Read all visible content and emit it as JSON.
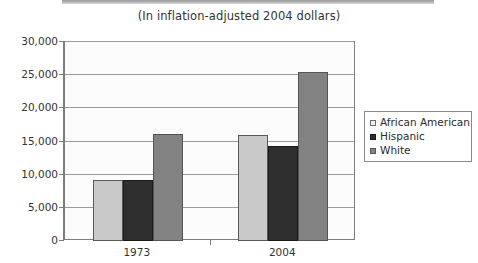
{
  "chart_data": {
    "type": "bar",
    "title": "(In inflation-adjusted 2004 dollars)",
    "xlabel": "",
    "ylabel": "",
    "categories": [
      "1973",
      "2004"
    ],
    "series": [
      {
        "name": "African American",
        "values": [
          9200,
          16000
        ],
        "color": "#c9c9c9"
      },
      {
        "name": "Hispanic",
        "values": [
          9150,
          14300
        ],
        "color": "#2f2f2f"
      },
      {
        "name": "White",
        "values": [
          16200,
          25500
        ],
        "color": "#828282"
      }
    ],
    "ylim": [
      0,
      30000
    ],
    "ytick_values": [
      0,
      5000,
      10000,
      15000,
      20000,
      25000,
      30000
    ],
    "ytick_labels": [
      "0",
      "5,000",
      "10,000",
      "15,000",
      "20,000",
      "25,000",
      "30,000"
    ],
    "grid": true,
    "legend_position": "right"
  },
  "legend": {
    "items": [
      {
        "label": "African American",
        "swatch": "legend-swatch-african-american"
      },
      {
        "label": "Hispanic",
        "swatch": "legend-swatch-hispanic"
      },
      {
        "label": "White",
        "swatch": "legend-swatch-white"
      }
    ]
  }
}
